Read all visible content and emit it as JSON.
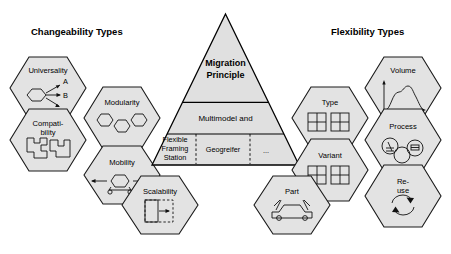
{
  "figure": {
    "background_color": "#ffffff",
    "hex_fill": "#e3e3e3",
    "hex_stroke": "#1a1a1a",
    "pyramid_fill": "#e0e0e0",
    "pyramid_stroke": "#000000"
  },
  "left_panel": {
    "title": "Changeability Types",
    "items": [
      {
        "label": "Universality",
        "icon": "hexagon-with-three-arrows-icon",
        "icon_labels": [
          "A",
          "B"
        ]
      },
      {
        "label": "Modularity",
        "icon": "three-interlocking-hexagons-icon",
        "icon_labels": []
      },
      {
        "label_line1": "Compati-",
        "label_line2": "bility",
        "label": "Compatibility",
        "icon": "interlocking-puzzle-pieces-icon",
        "icon_labels": []
      },
      {
        "label": "Mobility",
        "icon": "hexagon-on-wheels-with-arrows-icon",
        "icon_labels": []
      },
      {
        "label": "Scalability",
        "icon": "dashed-box-expansion-arrow-icon",
        "icon_labels": []
      }
    ]
  },
  "right_panel": {
    "title": "Flexibility Types",
    "items": [
      {
        "label": "Volume",
        "icon": "bell-curve-chart-icon",
        "icon_labels": []
      },
      {
        "label": "Type",
        "icon": "two-grid-squares-icon",
        "icon_labels": []
      },
      {
        "label": "Process",
        "icon": "three-overlapping-process-circles-icon",
        "icon_labels": []
      },
      {
        "label": "Variant",
        "icon": "two-grid-squares-icon",
        "icon_labels": []
      },
      {
        "label": "Part",
        "icon": "car-with-doors-icon",
        "icon_labels": []
      },
      {
        "label_line1": "Re-",
        "label_line2": "use",
        "label": "Re-use",
        "icon": "recycle-arrows-icon",
        "icon_labels": []
      }
    ]
  },
  "pyramid": {
    "tier_top": {
      "line1": "Migration",
      "line2": "Principle"
    },
    "tier_middle": {
      "text": "Multimodel and"
    },
    "tier_bottom": {
      "cells": [
        {
          "line1": "Flexible",
          "line2": "Framing",
          "line3": "Station"
        },
        {
          "line1": "Geogreifer"
        },
        {
          "line1": "..."
        }
      ]
    }
  }
}
